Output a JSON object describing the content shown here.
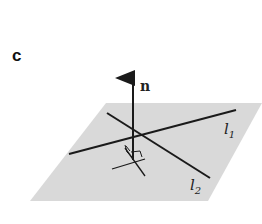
{
  "figure": {
    "panel_label": "c",
    "normal_label": "n",
    "line1_label": "l",
    "line1_sub": "1",
    "line2_label": "l",
    "line2_sub": "2"
  },
  "colors": {
    "plane": "#d9d9d9",
    "stroke": "#1a1a1a",
    "background": "#ffffff"
  }
}
